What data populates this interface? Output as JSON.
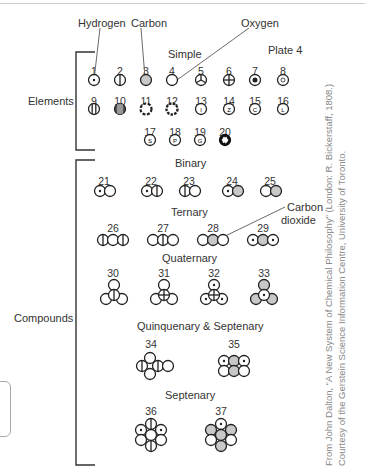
{
  "plate": "Plate 4",
  "callouts": {
    "hydrogen": "Hydrogen",
    "carbon": "Carbon",
    "oxygen": "Oxygen",
    "carbon_dioxide_1": "Carbon",
    "carbon_dioxide_2": "dioxide"
  },
  "groups": {
    "elements": "Elements",
    "compounds": "Compounds"
  },
  "sections": {
    "simple": "Simple",
    "binary": "Binary",
    "ternary": "Ternary",
    "quaternary": "Quaternary",
    "quinquenary": "Quinquenary & Septenary",
    "septenary": "Septenary"
  },
  "elements": [
    "1",
    "2",
    "3",
    "4",
    "5",
    "6",
    "7",
    "8",
    "9",
    "10",
    "11",
    "12",
    "13",
    "14",
    "15",
    "16",
    "17",
    "18",
    "19",
    "20"
  ],
  "compounds": [
    "21",
    "22",
    "23",
    "24",
    "25",
    "26",
    "27",
    "28",
    "29",
    "30",
    "31",
    "32",
    "33",
    "34",
    "35",
    "36",
    "37"
  ],
  "credit": {
    "line1": "From John Dalton, “A New System of Chemical Philosophy” (London: R. Bickerstaff, 1808.)",
    "line2": "Courtesy of the Gerstein Science Information Centre, University of Toronto."
  },
  "colors": {
    "gray_fill": "#c8c8c8",
    "line": "#222222"
  }
}
